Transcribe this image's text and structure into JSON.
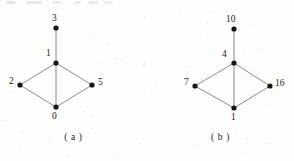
{
  "figure": {
    "type": "undirected-graph-pair",
    "background_color": "#fdfdfc",
    "edge_color": "#7d7d7d",
    "node_color": "#151515",
    "label_color": "#1a1a1a"
  },
  "graphs": [
    {
      "id": "a",
      "caption": "( a )",
      "nodes": [
        {
          "label": "3",
          "x": 56,
          "y": 28,
          "label_x": 52,
          "label_y": 14
        },
        {
          "label": "1",
          "x": 56,
          "y": 63,
          "label_x": 46,
          "label_y": 49
        },
        {
          "label": "2",
          "x": 20,
          "y": 85,
          "label_x": 9,
          "label_y": 77
        },
        {
          "label": "5",
          "x": 92,
          "y": 85,
          "label_x": 98,
          "label_y": 78
        },
        {
          "label": "0",
          "x": 56,
          "y": 107,
          "label_x": 52,
          "label_y": 112
        }
      ],
      "edges": [
        {
          "from": "3",
          "to": "1"
        },
        {
          "from": "1",
          "to": "2"
        },
        {
          "from": "1",
          "to": "5"
        },
        {
          "from": "1",
          "to": "0"
        },
        {
          "from": "2",
          "to": "0"
        },
        {
          "from": "0",
          "to": "5"
        }
      ]
    },
    {
      "id": "b",
      "caption": "( b )",
      "nodes": [
        {
          "label": "10",
          "x": 87,
          "y": 29,
          "label_x": 79,
          "label_y": 15
        },
        {
          "label": "4",
          "x": 87,
          "y": 63,
          "label_x": 75,
          "label_y": 50
        },
        {
          "label": "7",
          "x": 48,
          "y": 86,
          "label_x": 37,
          "label_y": 78
        },
        {
          "label": "16",
          "x": 123,
          "y": 86,
          "label_x": 128,
          "label_y": 79
        },
        {
          "label": "1",
          "x": 87,
          "y": 108,
          "label_x": 84,
          "label_y": 113
        }
      ],
      "edges": [
        {
          "from": "10",
          "to": "4"
        },
        {
          "from": "4",
          "to": "7"
        },
        {
          "from": "4",
          "to": "16"
        },
        {
          "from": "4",
          "to": "1"
        },
        {
          "from": "7",
          "to": "1"
        },
        {
          "from": "1",
          "to": "16"
        }
      ]
    }
  ]
}
